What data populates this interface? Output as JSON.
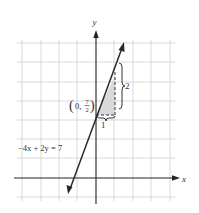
{
  "diagram": {
    "type": "coordinate-graph",
    "axes": {
      "x_label": "x",
      "y_label": "y"
    },
    "equation_label": "−4x + 2y = 7",
    "point_label": {
      "prefix": "(0, ",
      "fraction_num": "7",
      "fraction_den": "2",
      "suffix": ")"
    },
    "slope_triangle": {
      "run_label": "1",
      "rise_label": "2"
    },
    "colors": {
      "grid": "#c8c8c8",
      "axis": "#222222",
      "line": "#2a2a2a",
      "triangle_fill": "#d9d9d9"
    },
    "line": {
      "slope": 2,
      "y_intercept": 3.5
    }
  }
}
